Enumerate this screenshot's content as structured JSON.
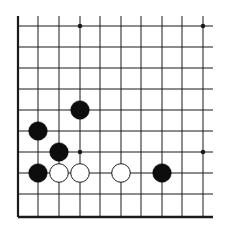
{
  "diagram": {
    "type": "go-board-corner",
    "corner": "lower-left",
    "grid": {
      "x_lines": [
        18,
        38,
        59,
        80,
        100,
        121,
        141,
        162,
        182,
        203
      ],
      "y_lines": [
        26,
        47,
        68,
        89,
        110,
        131,
        152,
        173,
        194,
        217
      ],
      "x_extent": [
        18,
        213
      ],
      "y_extent": [
        16,
        217
      ],
      "line_color": "#1a1a1a"
    },
    "star_points": [
      {
        "col": 3,
        "row": 0
      },
      {
        "col": 9,
        "row": 0
      },
      {
        "col": 3,
        "row": 6
      },
      {
        "col": 9,
        "row": 6
      }
    ],
    "stones": [
      {
        "color": "black",
        "col": 3,
        "row": 4
      },
      {
        "color": "black",
        "col": 1,
        "row": 5
      },
      {
        "color": "black",
        "col": 2,
        "row": 6
      },
      {
        "color": "black",
        "col": 1,
        "row": 7
      },
      {
        "color": "white",
        "col": 2,
        "row": 7
      },
      {
        "color": "white",
        "col": 3,
        "row": 7
      },
      {
        "color": "white",
        "col": 5,
        "row": 7
      },
      {
        "color": "black",
        "col": 7,
        "row": 7
      }
    ],
    "colors": {
      "black_stone": "#0d0d0d",
      "white_stone": "#ffffff",
      "white_stone_outline": "#1a1a1a",
      "background": "#ffffff"
    }
  }
}
